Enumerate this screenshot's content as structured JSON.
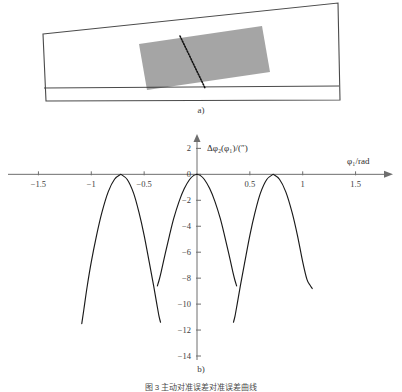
{
  "figure": {
    "panel_a_label": "a)",
    "panel_b_label": "b)",
    "caption": "图 3  主动对准误差对准误差曲线"
  },
  "panel_a": {
    "name": "tilted-plate-schematic",
    "outline_points": "43,34 338,3 340,100 46,101",
    "inner_line_points": "44,88 339,86",
    "hatch_region_points": "139,44 262,26 270,72 147,90",
    "dotted_line": {
      "x1": 180,
      "y1": 36,
      "x2": 205,
      "y2": 88
    },
    "hatch_spacing": 2.0,
    "hatch_count": 24
  },
  "chart_data": {
    "type": "line",
    "title": "",
    "xlabel": "φ₁/rad",
    "ylabel": "Δφ₂(φ₁)/(″)",
    "xlim": [
      -1.75,
      1.75
    ],
    "ylim": [
      -14,
      2.8
    ],
    "xticks": [
      -1.5,
      -1,
      -0.5,
      0.5,
      1,
      1.5
    ],
    "xticklabels": [
      "−1.5",
      "−1",
      "−0.5",
      "0.5",
      "1",
      "1.5"
    ],
    "yticks": [
      2,
      0,
      -2,
      -4,
      -6,
      -8,
      -10,
      -12,
      -14
    ],
    "yticklabels": [
      "2",
      "0",
      "−2",
      "−4",
      "−6",
      "−8",
      "−10",
      "−12",
      "−14"
    ],
    "grid": false,
    "legend": false,
    "axis_color": "#6e6e6e",
    "curve_color": "#1a1a1a",
    "series": [
      {
        "name": "branch-left-outer",
        "comment": "descends from peak 0 at -0.72 leftward to -11.5 at -1.09",
        "x": [
          -0.72,
          -0.78,
          -0.84,
          -0.9,
          -0.95,
          -1.0,
          -1.04,
          -1.07,
          -1.09
        ],
        "y": [
          0.0,
          -0.38,
          -1.35,
          -2.95,
          -4.7,
          -6.75,
          -8.7,
          -10.4,
          -11.5
        ]
      },
      {
        "name": "branch-left-inner",
        "comment": "descends from peak 0 at -0.72 rightward through crossing to -11.4 at -0.345",
        "x": [
          -0.72,
          -0.66,
          -0.6,
          -0.55,
          -0.5,
          -0.45,
          -0.41,
          -0.38,
          -0.36,
          -0.345
        ],
        "y": [
          0.0,
          -0.4,
          -1.45,
          -2.9,
          -4.7,
          -6.85,
          -8.6,
          -10.0,
          -10.9,
          -11.4
        ]
      },
      {
        "name": "branch-center-left",
        "comment": "from -8.2 near -0.365 rising to peak 0 at phi1 = 0",
        "x": [
          -0.375,
          -0.36,
          -0.34,
          -0.3,
          -0.26,
          -0.22,
          -0.17,
          -0.12,
          -0.07,
          -0.03,
          0.0
        ],
        "y": [
          -8.6,
          -8.2,
          -7.55,
          -6.1,
          -4.7,
          -3.4,
          -2.1,
          -1.1,
          -0.4,
          -0.08,
          0.0
        ]
      },
      {
        "name": "branch-center-right",
        "comment": "mirror: from peak 0 at 0 down to -8.6 near 0.375",
        "x": [
          0.0,
          0.03,
          0.07,
          0.12,
          0.17,
          0.22,
          0.26,
          0.3,
          0.34,
          0.36,
          0.375
        ],
        "y": [
          0.0,
          -0.08,
          -0.4,
          -1.1,
          -2.1,
          -3.4,
          -4.7,
          -6.1,
          -7.55,
          -8.2,
          -8.6
        ]
      },
      {
        "name": "branch-right-inner",
        "comment": "mirror of branch-left-inner",
        "x": [
          0.345,
          0.36,
          0.38,
          0.41,
          0.45,
          0.5,
          0.55,
          0.6,
          0.66,
          0.72
        ],
        "y": [
          -11.4,
          -10.9,
          -10.0,
          -8.6,
          -6.85,
          -4.7,
          -2.9,
          -1.45,
          -0.4,
          0.0
        ]
      },
      {
        "name": "branch-right-outer",
        "comment": "mirror of branch-left-outer, descends to -8.8 at 1.09",
        "x": [
          0.72,
          0.78,
          0.84,
          0.9,
          0.95,
          1.0,
          1.04,
          1.07,
          1.09
        ],
        "y": [
          0.0,
          -0.38,
          -1.35,
          -2.95,
          -4.7,
          -6.75,
          -8.1,
          -8.55,
          -8.8
        ]
      }
    ]
  }
}
